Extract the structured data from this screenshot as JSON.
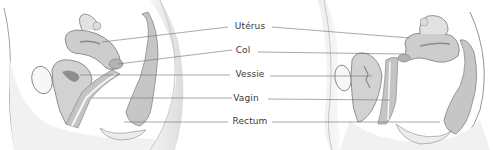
{
  "diagram": {
    "type": "anatomical-labeled-illustration",
    "views": [
      {
        "id": "left",
        "description": "Sagittal section of female pelvis, uterus anteverted (tilted forward)"
      },
      {
        "id": "right",
        "description": "Sagittal section of female pelvis, uterus retroverted (tilted backward)"
      }
    ],
    "labels": [
      {
        "text": "Utérus",
        "x": 250,
        "y": 26
      },
      {
        "text": "Col",
        "x": 243,
        "y": 50
      },
      {
        "text": "Vessie",
        "x": 250,
        "y": 73
      },
      {
        "text": "Vagin",
        "x": 246,
        "y": 97
      },
      {
        "text": "Rectum",
        "x": 250,
        "y": 120
      }
    ],
    "colors": {
      "line": "#6e6e6e",
      "organ_fill": "#c9c9c9",
      "organ_dark": "#9a9a9a",
      "skin_shade": "#e4e4e4",
      "text": "#3a3a3a"
    }
  }
}
